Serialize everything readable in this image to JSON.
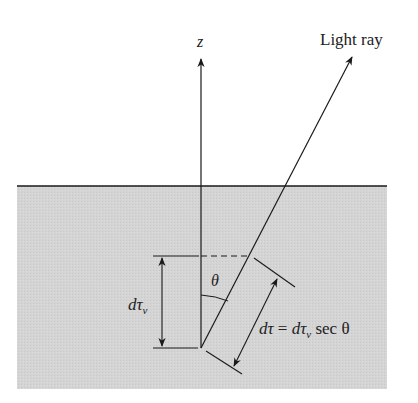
{
  "figure": {
    "labels": {
      "z_axis": "z",
      "light_ray": "Light ray",
      "theta": "θ",
      "vertical_depth": {
        "main": "dτ",
        "sub": "ν"
      },
      "slant_depth": {
        "lhs": "dτ",
        "eq": " = ",
        "rhs_main": "dτ",
        "rhs_sub": "ν",
        "rhs_tail": " sec θ"
      }
    },
    "colors": {
      "medium_fill": "#d4d4d4",
      "line": "#1a1a1a",
      "background": "#ffffff"
    }
  }
}
